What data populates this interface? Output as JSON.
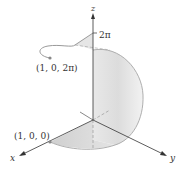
{
  "figure": {
    "axes": {
      "x_label": "x",
      "y_label": "y",
      "z_label": "z"
    },
    "z_tick_label": "2π",
    "points": [
      {
        "label": "(1, 0, 0)",
        "role": "start-point"
      },
      {
        "label": "(1, 0, 2π)",
        "role": "end-point"
      }
    ],
    "colors": {
      "axis": "#333333",
      "curve": "#999999",
      "surface_fill": "#d9d9d9",
      "surface_edge": "#a0a0a0",
      "dashed": "#999999"
    }
  }
}
